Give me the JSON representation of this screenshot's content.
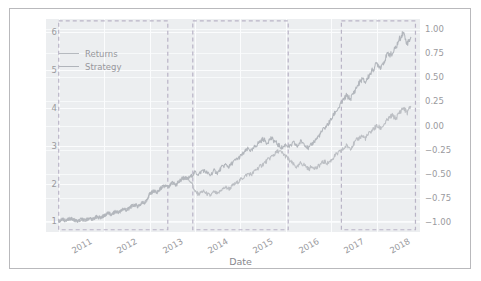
{
  "figure": {
    "background": "#ffffff",
    "plot_background": "#eceef0",
    "border_color": "#b9b9bc",
    "grid_color": "#fbfcfd"
  },
  "legend": {
    "position": "upper-left-inside",
    "items": [
      {
        "label": "Returns",
        "color": "#b6babf"
      },
      {
        "label": "Strategy",
        "color": "#b0b4ba"
      }
    ]
  },
  "chart_data": {
    "type": "line",
    "title": "",
    "xlabel": "Date",
    "ylabel": "",
    "grid": true,
    "legend_position": "upper left",
    "xlim": [
      "2010-09",
      "2018-11"
    ],
    "x_tick_labels": [
      "2011",
      "2012",
      "2013",
      "2014",
      "2015",
      "2016",
      "2017",
      "2018"
    ],
    "y_left": {
      "label": "",
      "ylim": [
        0.72,
        6.35
      ],
      "ticks": [
        1,
        2,
        3,
        4,
        5,
        6
      ],
      "tick_labels": [
        "1",
        "2",
        "3",
        "4",
        "5",
        "6"
      ]
    },
    "y_right": {
      "label": "",
      "ylim": [
        -1.1,
        1.1
      ],
      "ticks": [
        1.0,
        0.75,
        0.5,
        0.25,
        0.0,
        -0.25,
        -0.5,
        -0.75,
        -1.0
      ],
      "tick_labels": [
        "1.00",
        "0.75",
        "0.50",
        "0.25",
        "0.00",
        "−0.25",
        "−0.50",
        "−0.75",
        "−1.00"
      ]
    },
    "series": [
      {
        "name": "Returns",
        "color": "#bcbfc4",
        "axis": "left",
        "x": [
          "2011.00",
          "2011.08",
          "2011.17",
          "2011.25",
          "2011.33",
          "2011.42",
          "2011.50",
          "2011.58",
          "2011.67",
          "2011.75",
          "2011.83",
          "2011.92",
          "2012.00",
          "2012.08",
          "2012.17",
          "2012.25",
          "2012.33",
          "2012.42",
          "2012.50",
          "2012.58",
          "2012.67",
          "2012.75",
          "2012.83",
          "2012.92",
          "2013.00",
          "2013.08",
          "2013.17",
          "2013.25",
          "2013.33",
          "2013.42",
          "2013.50",
          "2013.58",
          "2013.67",
          "2013.75",
          "2013.83",
          "2013.92",
          "2014.00",
          "2014.08",
          "2014.17",
          "2014.25",
          "2014.33",
          "2014.42",
          "2014.50",
          "2014.58",
          "2014.67",
          "2014.75",
          "2014.83",
          "2014.92",
          "2015.00",
          "2015.08",
          "2015.17",
          "2015.25",
          "2015.33",
          "2015.42",
          "2015.50",
          "2015.58",
          "2015.67",
          "2015.75",
          "2015.83",
          "2015.92",
          "2016.00",
          "2016.08",
          "2016.17",
          "2016.25",
          "2016.33",
          "2016.42",
          "2016.50",
          "2016.58",
          "2016.67",
          "2016.75",
          "2016.83",
          "2016.92",
          "2017.00",
          "2017.08",
          "2017.17",
          "2017.25",
          "2017.33",
          "2017.42",
          "2017.50",
          "2017.58",
          "2017.67",
          "2017.75",
          "2017.83",
          "2017.92",
          "2018.00",
          "2018.08",
          "2018.17",
          "2018.25",
          "2018.33",
          "2018.42",
          "2018.50",
          "2018.58",
          "2018.67",
          "2018.75"
        ],
        "values": [
          1.0,
          1.05,
          1.02,
          1.08,
          1.04,
          1.0,
          1.06,
          1.03,
          1.09,
          1.06,
          1.12,
          1.1,
          1.15,
          1.22,
          1.18,
          1.26,
          1.24,
          1.33,
          1.3,
          1.38,
          1.44,
          1.4,
          1.48,
          1.52,
          1.72,
          1.8,
          1.76,
          1.88,
          1.94,
          1.9,
          2.02,
          1.96,
          2.08,
          2.16,
          2.12,
          2.05,
          1.78,
          1.72,
          1.8,
          1.74,
          1.68,
          1.78,
          1.72,
          1.84,
          1.9,
          1.86,
          1.95,
          2.02,
          2.1,
          2.18,
          2.26,
          2.24,
          2.36,
          2.44,
          2.52,
          2.6,
          2.7,
          2.78,
          2.86,
          2.8,
          2.72,
          2.6,
          2.5,
          2.42,
          2.55,
          2.48,
          2.38,
          2.46,
          2.4,
          2.5,
          2.58,
          2.54,
          2.62,
          2.74,
          2.82,
          2.9,
          3.0,
          2.94,
          3.06,
          3.18,
          3.26,
          3.2,
          3.32,
          3.44,
          3.52,
          3.46,
          3.58,
          3.7,
          3.8,
          3.72,
          3.88,
          4.0,
          3.88,
          4.05
        ]
      },
      {
        "name": "Strategy",
        "color": "#b2b6bc",
        "axis": "left",
        "x": [
          "2011.00",
          "2011.08",
          "2011.17",
          "2011.25",
          "2011.33",
          "2011.42",
          "2011.50",
          "2011.58",
          "2011.67",
          "2011.75",
          "2011.83",
          "2011.92",
          "2012.00",
          "2012.08",
          "2012.17",
          "2012.25",
          "2012.33",
          "2012.42",
          "2012.50",
          "2012.58",
          "2012.67",
          "2012.75",
          "2012.83",
          "2012.92",
          "2013.00",
          "2013.08",
          "2013.17",
          "2013.25",
          "2013.33",
          "2013.42",
          "2013.50",
          "2013.58",
          "2013.67",
          "2013.75",
          "2013.83",
          "2013.92",
          "2014.00",
          "2014.08",
          "2014.17",
          "2014.25",
          "2014.33",
          "2014.42",
          "2014.50",
          "2014.58",
          "2014.67",
          "2014.75",
          "2014.83",
          "2014.92",
          "2015.00",
          "2015.08",
          "2015.17",
          "2015.25",
          "2015.33",
          "2015.42",
          "2015.50",
          "2015.58",
          "2015.67",
          "2015.75",
          "2015.83",
          "2015.92",
          "2016.00",
          "2016.08",
          "2016.17",
          "2016.25",
          "2016.33",
          "2016.42",
          "2016.50",
          "2016.58",
          "2016.67",
          "2016.75",
          "2016.83",
          "2016.92",
          "2017.00",
          "2017.08",
          "2017.17",
          "2017.25",
          "2017.33",
          "2017.42",
          "2017.50",
          "2017.58",
          "2017.67",
          "2017.75",
          "2017.83",
          "2017.92",
          "2018.00",
          "2018.08",
          "2018.17",
          "2018.25",
          "2018.33",
          "2018.42",
          "2018.50",
          "2018.58",
          "2018.67",
          "2018.75"
        ],
        "values": [
          1.0,
          1.05,
          1.02,
          1.08,
          1.04,
          1.0,
          1.06,
          1.03,
          1.09,
          1.06,
          1.12,
          1.1,
          1.15,
          1.22,
          1.18,
          1.26,
          1.24,
          1.33,
          1.3,
          1.38,
          1.44,
          1.4,
          1.48,
          1.52,
          1.72,
          1.8,
          1.76,
          1.88,
          1.94,
          1.9,
          2.02,
          1.96,
          2.08,
          2.16,
          2.12,
          2.2,
          2.3,
          2.24,
          2.36,
          2.3,
          2.22,
          2.34,
          2.28,
          2.42,
          2.5,
          2.44,
          2.56,
          2.64,
          2.72,
          2.82,
          2.92,
          2.86,
          3.0,
          3.1,
          3.18,
          3.08,
          3.2,
          3.12,
          3.02,
          2.94,
          3.04,
          2.96,
          3.08,
          2.98,
          3.12,
          3.04,
          2.92,
          3.06,
          3.18,
          3.3,
          3.44,
          3.56,
          3.7,
          3.88,
          4.02,
          4.18,
          4.32,
          4.24,
          4.42,
          4.6,
          4.76,
          4.68,
          4.86,
          5.02,
          5.18,
          5.08,
          5.26,
          5.44,
          5.4,
          5.6,
          5.82,
          6.0,
          5.7,
          5.88
        ]
      }
    ],
    "highlight_regions": [
      {
        "name": "region-1",
        "x_start": "2011.00",
        "x_end": "2013.40",
        "y_top": 6.3,
        "y_bottom": 0.78,
        "style": "dashed",
        "color": "#b9b4c6"
      },
      {
        "name": "region-2",
        "x_start": "2013.95",
        "x_end": "2016.05",
        "y_top": 6.3,
        "y_bottom": 0.78,
        "style": "dashed",
        "color": "#b9b4c6"
      },
      {
        "name": "region-3",
        "x_start": "2017.22",
        "x_end": "2018.85",
        "y_top": 6.3,
        "y_bottom": 0.78,
        "style": "dashed",
        "color": "#b9b4c6"
      }
    ]
  }
}
